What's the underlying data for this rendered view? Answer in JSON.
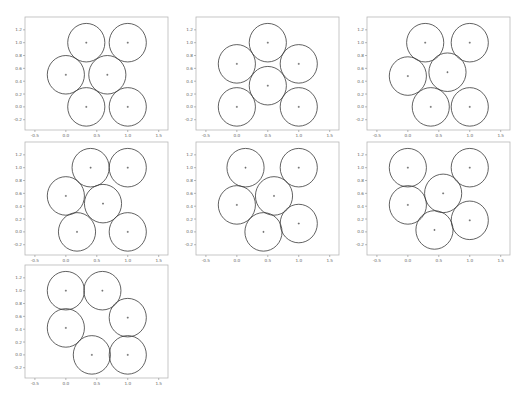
{
  "layout": {
    "frame_width": 143,
    "frame_height": 113,
    "positions": [
      {
        "left": 25,
        "top": 17
      },
      {
        "left": 196,
        "top": 17
      },
      {
        "left": 367,
        "top": 17
      },
      {
        "left": 25,
        "top": 142
      },
      {
        "left": 196,
        "top": 142
      },
      {
        "left": 367,
        "top": 142
      },
      {
        "left": 25,
        "top": 265
      }
    ]
  },
  "chart_data": [
    {
      "type": "scatter",
      "title": "",
      "xlabel": "",
      "ylabel": "",
      "xlim": [
        -0.66,
        1.65
      ],
      "ylim": [
        -0.36,
        1.4
      ],
      "grid": false,
      "xticks": [
        "-0.5",
        "0.0",
        "0.5",
        "1.0",
        "1.5"
      ],
      "yticks": [
        "-0.2",
        "0.0",
        "0.2",
        "0.4",
        "0.6",
        "0.8",
        "1.0",
        "1.2"
      ],
      "circle_radius": 0.3,
      "centers": [
        [
          0.33,
          1.0
        ],
        [
          1.0,
          1.0
        ],
        [
          0.0,
          0.5
        ],
        [
          0.67,
          0.5
        ],
        [
          0.33,
          0.0
        ],
        [
          1.0,
          0.0
        ]
      ]
    },
    {
      "type": "scatter",
      "title": "",
      "xlabel": "",
      "ylabel": "",
      "xlim": [
        -0.66,
        1.65
      ],
      "ylim": [
        -0.36,
        1.4
      ],
      "grid": false,
      "xticks": [
        "-0.5",
        "0.0",
        "0.5",
        "1.0",
        "1.5"
      ],
      "yticks": [
        "-0.2",
        "0.0",
        "0.2",
        "0.4",
        "0.6",
        "0.8",
        "1.0",
        "1.2"
      ],
      "circle_radius": 0.3,
      "centers": [
        [
          0.5,
          1.0
        ],
        [
          0.0,
          0.67
        ],
        [
          1.0,
          0.67
        ],
        [
          0.5,
          0.33
        ],
        [
          0.0,
          0.0
        ],
        [
          1.0,
          0.0
        ]
      ]
    },
    {
      "type": "scatter",
      "title": "",
      "xlabel": "",
      "ylabel": "",
      "xlim": [
        -0.66,
        1.65
      ],
      "ylim": [
        -0.36,
        1.4
      ],
      "grid": false,
      "xticks": [
        "-0.5",
        "0.0",
        "0.5",
        "1.0",
        "1.5"
      ],
      "yticks": [
        "-0.2",
        "0.0",
        "0.2",
        "0.4",
        "0.6",
        "0.8",
        "1.0",
        "1.2"
      ],
      "circle_radius": 0.3,
      "centers": [
        [
          0.28,
          1.0
        ],
        [
          1.0,
          1.0
        ],
        [
          0.0,
          0.48
        ],
        [
          0.64,
          0.54
        ],
        [
          0.37,
          0.0
        ],
        [
          1.0,
          0.0
        ]
      ]
    },
    {
      "type": "scatter",
      "title": "",
      "xlabel": "",
      "ylabel": "",
      "xlim": [
        -0.66,
        1.65
      ],
      "ylim": [
        -0.36,
        1.4
      ],
      "grid": false,
      "xticks": [
        "-0.5",
        "0.0",
        "0.5",
        "1.0",
        "1.5"
      ],
      "yticks": [
        "-0.2",
        "0.0",
        "0.2",
        "0.4",
        "0.6",
        "0.8",
        "1.0",
        "1.2"
      ],
      "circle_radius": 0.3,
      "centers": [
        [
          0.4,
          1.0
        ],
        [
          1.0,
          1.0
        ],
        [
          0.0,
          0.56
        ],
        [
          0.6,
          0.44
        ],
        [
          0.18,
          0.0
        ],
        [
          1.0,
          0.0
        ]
      ]
    },
    {
      "type": "scatter",
      "title": "",
      "xlabel": "",
      "ylabel": "",
      "xlim": [
        -0.66,
        1.65
      ],
      "ylim": [
        -0.36,
        1.4
      ],
      "grid": false,
      "xticks": [
        "-0.5",
        "0.0",
        "0.5",
        "1.0",
        "1.5"
      ],
      "yticks": [
        "-0.2",
        "0.0",
        "0.2",
        "0.4",
        "0.6",
        "0.8",
        "1.0",
        "1.2"
      ],
      "circle_radius": 0.3,
      "centers": [
        [
          0.14,
          1.0
        ],
        [
          1.0,
          1.0
        ],
        [
          0.0,
          0.42
        ],
        [
          0.6,
          0.56
        ],
        [
          0.43,
          0.0
        ],
        [
          1.0,
          0.13
        ]
      ]
    },
    {
      "type": "scatter",
      "title": "",
      "xlabel": "",
      "ylabel": "",
      "xlim": [
        -0.66,
        1.65
      ],
      "ylim": [
        -0.36,
        1.4
      ],
      "grid": false,
      "xticks": [
        "-0.5",
        "0.0",
        "0.5",
        "1.0",
        "1.5"
      ],
      "yticks": [
        "-0.2",
        "0.0",
        "0.2",
        "0.4",
        "0.6",
        "0.8",
        "1.0",
        "1.2"
      ],
      "circle_radius": 0.3,
      "centers": [
        [
          0.0,
          1.0
        ],
        [
          1.0,
          1.0
        ],
        [
          0.0,
          0.42
        ],
        [
          0.57,
          0.6
        ],
        [
          0.43,
          0.03
        ],
        [
          1.0,
          0.18
        ]
      ]
    },
    {
      "type": "scatter",
      "title": "",
      "xlabel": "",
      "ylabel": "",
      "xlim": [
        -0.66,
        1.65
      ],
      "ylim": [
        -0.36,
        1.4
      ],
      "grid": false,
      "xticks": [
        "-0.5",
        "0.0",
        "0.5",
        "1.0",
        "1.5"
      ],
      "yticks": [
        "-0.2",
        "0.0",
        "0.2",
        "0.4",
        "0.6",
        "0.8",
        "1.0",
        "1.2"
      ],
      "circle_radius": 0.3,
      "centers": [
        [
          0.0,
          1.0
        ],
        [
          0.59,
          1.0
        ],
        [
          1.0,
          0.58
        ],
        [
          0.0,
          0.42
        ],
        [
          0.42,
          0.0
        ],
        [
          1.0,
          0.0
        ]
      ]
    }
  ]
}
